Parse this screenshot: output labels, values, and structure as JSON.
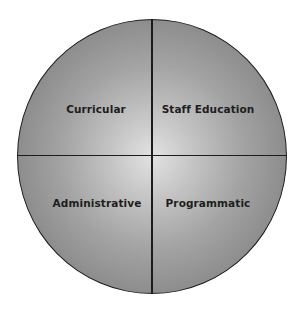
{
  "diagram": {
    "type": "quadrant-circle",
    "colors": {
      "center": "#e2e2e2",
      "edge": "#7a7a7a",
      "lines": "#1c1c1c",
      "text": "#1e1e1e"
    },
    "quadrants": {
      "top_left": "Curricular",
      "top_right": "Staff Education",
      "bottom_left": "Administrative",
      "bottom_right": "Programmatic"
    }
  }
}
